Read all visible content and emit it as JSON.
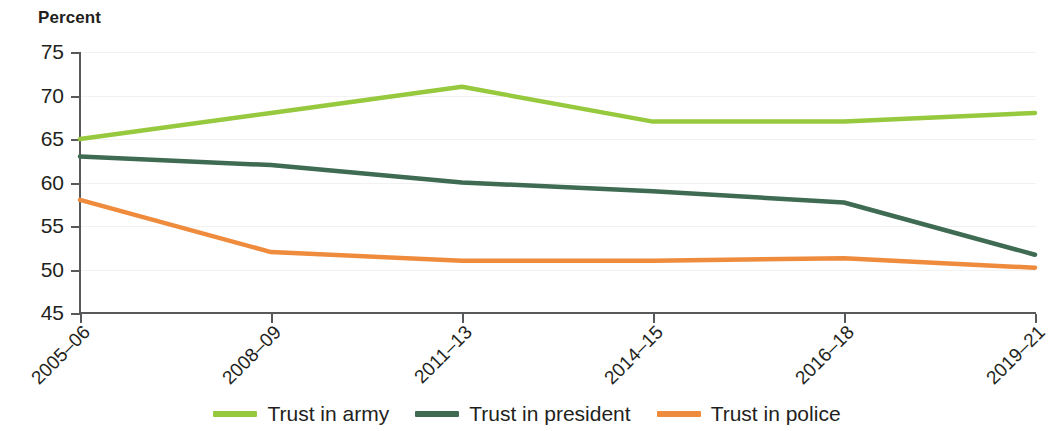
{
  "chart_data": {
    "type": "line",
    "title": "",
    "subtitle": "",
    "xlabel": "",
    "ylabel": "Percent",
    "categories": [
      "2005–06",
      "2008–09",
      "2011–13",
      "2014–15",
      "2016–18",
      "2019–21"
    ],
    "ylim": [
      45,
      75
    ],
    "yticks": [
      45,
      50,
      55,
      60,
      65,
      70,
      75
    ],
    "ytick_labels": [
      "45",
      "50",
      "55",
      "60",
      "65",
      "70",
      "75"
    ],
    "grid": true,
    "legend_position": "bottom",
    "series": [
      {
        "name": "Trust in army",
        "color": "#96c93d",
        "values": [
          65,
          68,
          71,
          67,
          67,
          68
        ]
      },
      {
        "name": "Trust in president",
        "color": "#3e6b52",
        "values": [
          63,
          62,
          60,
          59,
          57.7,
          51.7
        ]
      },
      {
        "name": "Trust in police",
        "color": "#ef8b3c",
        "values": [
          58,
          52,
          51,
          51,
          51.3,
          50.2
        ]
      }
    ]
  },
  "axis": {
    "y_title": "Percent"
  },
  "legend": {
    "items": [
      {
        "label": "Trust in army",
        "color": "#96c93d"
      },
      {
        "label": "Trust in president",
        "color": "#3e6b52"
      },
      {
        "label": "Trust in police",
        "color": "#ef8b3c"
      }
    ]
  }
}
